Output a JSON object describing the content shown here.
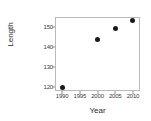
{
  "chart_data": {
    "type": "scatter",
    "title": "",
    "xlabel": "Year",
    "ylabel": "Length",
    "xlim": [
      1988,
      2012
    ],
    "ylim": [
      118,
      155
    ],
    "grid": false,
    "legend": null,
    "xticks": [
      1990,
      1995,
      2000,
      2005,
      2010
    ],
    "xtick_labels": [
      "1990",
      "1995",
      "2000",
      "2005",
      "2010"
    ],
    "yticks": [
      120,
      130,
      140,
      150
    ],
    "ytick_labels": [
      "120",
      "130",
      "140",
      "150"
    ],
    "marker": {
      "shape": "circle",
      "color": "#1a1a1a",
      "size": 5
    },
    "points": [
      {
        "x": 1990,
        "y": 120.0
      },
      {
        "x": 2000,
        "y": 144.0
      },
      {
        "x": 2005,
        "y": 149.5
      },
      {
        "x": 2010,
        "y": 153.5
      }
    ],
    "series": [
      {
        "name": "Length",
        "x": [
          1990,
          2000,
          2005,
          2010
        ],
        "values": [
          120.0,
          144.0,
          149.5,
          153.5
        ]
      }
    ],
    "frame": {
      "color": "#b9b9b9",
      "left_px": 55,
      "top_px": 17,
      "width_px": 85,
      "height_px": 74
    }
  }
}
